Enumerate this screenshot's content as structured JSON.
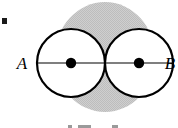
{
  "figure": {
    "kind": "geometry-diagram",
    "background_color": "#ffffff",
    "canvas": {
      "width": 178,
      "height": 128
    }
  },
  "shaded_region": {
    "name": "large-shaded-circle",
    "fill_color": "#c9c9c9",
    "stroke": "none",
    "center_x": 105,
    "center_y": 57,
    "radius_x": 50,
    "radius_y": 55,
    "clipped_at_top": true,
    "halftone": true
  },
  "circles": [
    {
      "name": "left-circle",
      "center_x": 71,
      "center_y": 63,
      "radius": 34,
      "fill_color": "#ffffff",
      "stroke_color": "#000000",
      "stroke_width": 2.2
    },
    {
      "name": "right-circle",
      "center_x": 139,
      "center_y": 63,
      "radius": 34,
      "fill_color": "#ffffff",
      "stroke_color": "#000000",
      "stroke_width": 2.2
    }
  ],
  "center_dots": [
    {
      "name": "left-center-dot",
      "cx": 71,
      "cy": 63,
      "radius": 5.2,
      "color": "#000000"
    },
    {
      "name": "right-center-dot",
      "cx": 139,
      "cy": 63,
      "radius": 5.2,
      "color": "#000000"
    }
  ],
  "diameter_line": {
    "name": "segment-AB",
    "x1": 36,
    "y1": 63,
    "x2": 174,
    "y2": 63,
    "color": "#000000",
    "stroke_width": 1.1
  },
  "labels": {
    "left": {
      "text": "A",
      "x": 22,
      "y": 63,
      "font_size": 17,
      "italic": true,
      "color": "#000000"
    },
    "right": {
      "text": "B",
      "x": 170,
      "y": 63,
      "font_size": 17,
      "italic": true,
      "color": "#000000",
      "clipped_at_right": true
    }
  },
  "artifacts": {
    "corner_mark": {
      "name": "scan-artifact-square",
      "x": 2,
      "y": 18,
      "width": 5,
      "height": 6,
      "color": "#1a1a1a"
    },
    "bottom_caption_remnant": {
      "name": "clipped-caption-strip",
      "note": "tops of cut-off caption glyphs along the very bottom edge",
      "color": "#9a9a9a",
      "y": 125,
      "glyph_tops": [
        {
          "x": 68,
          "width": 4
        },
        {
          "x": 78,
          "width": 13
        },
        {
          "x": 112,
          "width": 6
        }
      ]
    }
  }
}
